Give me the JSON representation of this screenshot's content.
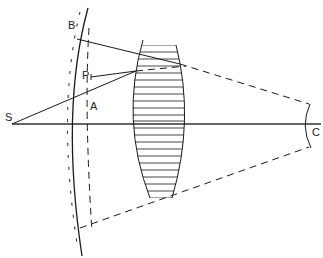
{
  "diagram": {
    "title": "",
    "labels": {
      "S": "S",
      "B": "B",
      "P": "P",
      "A": "A",
      "C": "C"
    },
    "elements": [
      {
        "id": "source-point",
        "label": "S",
        "description": "point source on optical axis"
      },
      {
        "id": "wavefront-solid",
        "label": "B",
        "description": "solid curved wavefront"
      },
      {
        "id": "wavefront-dashed",
        "label": "A",
        "description": "dashed reference surface"
      },
      {
        "id": "point-p",
        "label": "P",
        "description": "point P connected to lens edge"
      },
      {
        "id": "lens",
        "description": "hatched lens element"
      },
      {
        "id": "mirror-c",
        "label": "C",
        "description": "curved surface at C on axis"
      }
    ],
    "colors": {
      "ink": "#1a1a1a",
      "background": "#ffffff"
    }
  }
}
